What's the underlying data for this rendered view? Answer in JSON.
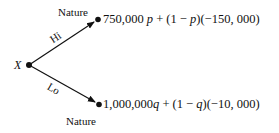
{
  "diagram": {
    "type": "decision-tree",
    "root": {
      "label": "X"
    },
    "branches": [
      {
        "label": "Hi",
        "chance_node_label": "Nature",
        "outcome": {
          "text": "750,000 p + (1 − p)(−150, 000)",
          "parts": [
            "750,000",
            "p",
            " + (1 − ",
            "p",
            ")(−150, 000)"
          ]
        }
      },
      {
        "label": "Lo",
        "chance_node_label": "Nature",
        "outcome": {
          "text": "1,000,000q + (1 − q)(−10, 000)",
          "parts": [
            "1,000,000",
            "q",
            " + (1 − ",
            "q",
            ")(−10, 000)"
          ]
        }
      }
    ]
  }
}
